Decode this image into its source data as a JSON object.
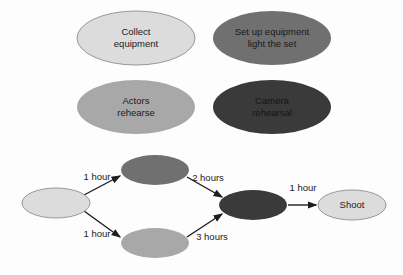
{
  "diagram": {
    "background_color": "#fdfdfd",
    "palette": {
      "light": "#dcdcdc",
      "medium": "#a8a8a8",
      "dark": "#707070",
      "darkest": "#3a3a3a",
      "outline": "#8c8c8c",
      "arrow": "#1d1d1d",
      "text": "#1a1a1a"
    },
    "legend": {
      "nodes": [
        {
          "id": "collect-equipment",
          "lines": [
            "Collect",
            "equipment"
          ],
          "fill": "#dcdcdc",
          "outlined": true,
          "cx": 136,
          "cy": 38,
          "rx": 59,
          "ry": 27
        },
        {
          "id": "set-up-equipment",
          "lines": [
            "Set up equipment",
            "light the set"
          ],
          "fill": "#707070",
          "outlined": false,
          "cx": 272,
          "cy": 38,
          "rx": 59,
          "ry": 27
        },
        {
          "id": "actors-rehearse",
          "lines": [
            "Actors",
            "rehearse"
          ],
          "fill": "#a8a8a8",
          "outlined": false,
          "cx": 136,
          "cy": 107,
          "rx": 59,
          "ry": 27
        },
        {
          "id": "camera-rehearsal",
          "lines": [
            "Camera",
            "rehearsal"
          ],
          "fill": "#3a3a3a",
          "outlined": false,
          "cx": 272,
          "cy": 107,
          "rx": 59,
          "ry": 27
        }
      ]
    },
    "network": {
      "nodes": [
        {
          "id": "start",
          "label": "",
          "fill": "#dcdcdc",
          "outlined": true,
          "cx": 56,
          "cy": 203,
          "rx": 34,
          "ry": 15
        },
        {
          "id": "setup-task",
          "label": "",
          "fill": "#707070",
          "outlined": false,
          "cx": 155,
          "cy": 170,
          "rx": 34,
          "ry": 15
        },
        {
          "id": "actors-task",
          "label": "",
          "fill": "#a8a8a8",
          "outlined": false,
          "cx": 155,
          "cy": 243,
          "rx": 34,
          "ry": 15
        },
        {
          "id": "camera-task",
          "label": "",
          "fill": "#3a3a3a",
          "outlined": false,
          "cx": 253,
          "cy": 205,
          "rx": 34,
          "ry": 15
        },
        {
          "id": "shoot",
          "label": "Shoot",
          "fill": "#dcdcdc",
          "outlined": true,
          "cx": 352,
          "cy": 205,
          "rx": 34,
          "ry": 15
        }
      ],
      "edges": [
        {
          "id": "start-to-setup",
          "label": "1 hour",
          "from": "start",
          "to": "setup-task",
          "x1": 84,
          "y1": 195,
          "x2": 120,
          "y2": 176,
          "label_x": 97,
          "label_y": 177
        },
        {
          "id": "start-to-actors",
          "label": "1 hour",
          "from": "start",
          "to": "actors-task",
          "x1": 84,
          "y1": 211,
          "x2": 120,
          "y2": 237,
          "label_x": 97,
          "label_y": 234
        },
        {
          "id": "setup-to-camera",
          "label": "2 hours",
          "from": "setup-task",
          "to": "camera-task",
          "x1": 187,
          "y1": 177,
          "x2": 222,
          "y2": 197,
          "label_x": 208,
          "label_y": 178
        },
        {
          "id": "actors-to-camera",
          "label": "3 hours",
          "from": "actors-task",
          "to": "camera-task",
          "x1": 187,
          "y1": 237,
          "x2": 222,
          "y2": 214,
          "label_x": 212,
          "label_y": 237
        },
        {
          "id": "camera-to-shoot",
          "label": "1 hour",
          "from": "camera-task",
          "to": "shoot",
          "x1": 288,
          "y1": 205,
          "x2": 316,
          "y2": 205,
          "label_x": 303,
          "label_y": 188
        }
      ]
    }
  }
}
